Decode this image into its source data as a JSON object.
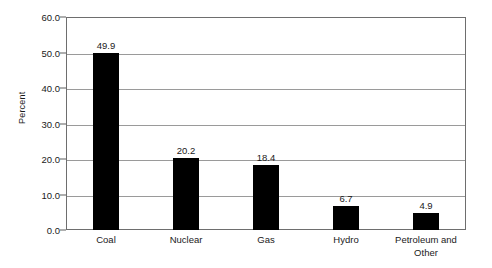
{
  "chart_data": {
    "type": "bar",
    "title": "",
    "subtitle": "",
    "xlabel": "",
    "ylabel": "Percent",
    "categories": [
      "Coal",
      "Nuclear",
      "Gas",
      "Hydro",
      "Petroleum and Other"
    ],
    "values": [
      49.9,
      20.2,
      18.4,
      6.7,
      4.9
    ],
    "value_labels": [
      "49.9",
      "20.2",
      "18.4",
      "6.7",
      "4.9"
    ],
    "ylim": [
      0.0,
      60.0
    ],
    "ytick_labels": [
      "0.0",
      "10.0",
      "20.0",
      "30.0",
      "40.0",
      "50.0",
      "60.0"
    ],
    "ytick_values": [
      0,
      10,
      20,
      30,
      40,
      50,
      60
    ],
    "grid": "horizontal",
    "legend": "none",
    "bar_color": "#000000",
    "gridline_color": "#9a9a9a",
    "axis_color": "#6e6e6e",
    "background_color": "#ffffff"
  }
}
